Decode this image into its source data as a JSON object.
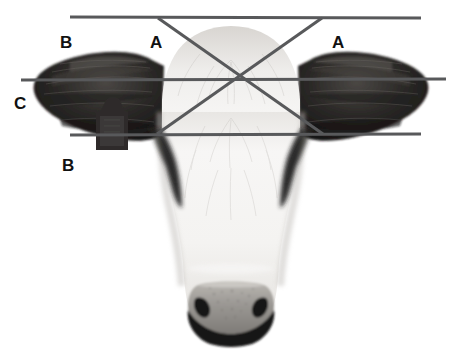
{
  "figure": {
    "background_color": "#ffffff",
    "width_px": 461,
    "height_px": 356
  },
  "annotation": {
    "line_color": "#58595b",
    "line_width_px": 3,
    "lines": [
      {
        "id": "top-horizontal",
        "name": "top-horizontal-line",
        "x1": 70,
        "y1": 17,
        "x2": 421,
        "y2": 18
      },
      {
        "id": "middle-horizontal",
        "name": "middle-horizontal-line",
        "x1": 21,
        "y1": 80,
        "x2": 446,
        "y2": 79
      },
      {
        "id": "bottom-horizontal",
        "name": "bottom-horizontal-line",
        "x1": 70,
        "y1": 135,
        "x2": 421,
        "y2": 134
      },
      {
        "id": "diagonal-left-to-right",
        "name": "diagonal-down-right-line",
        "x1": 158,
        "y1": 18,
        "x2": 323,
        "y2": 134
      },
      {
        "id": "diagonal-right-to-left",
        "name": "diagonal-down-left-line",
        "x1": 322,
        "y1": 18,
        "x2": 157,
        "y2": 134
      }
    ],
    "intersection": {
      "name": "cross-intersection-point",
      "x": 240,
      "y": 79
    }
  },
  "labels": [
    {
      "id": "label-b-top-left",
      "text": "B",
      "x": 60,
      "y": 34
    },
    {
      "id": "label-a-left",
      "text": "A",
      "x": 150,
      "y": 34
    },
    {
      "id": "label-a-right",
      "text": "A",
      "x": 332,
      "y": 34
    },
    {
      "id": "label-c-left",
      "text": "C",
      "x": 14,
      "y": 95
    },
    {
      "id": "label-b-bottom-left",
      "text": "B",
      "x": 62,
      "y": 157
    }
  ],
  "photo": {
    "description": "Black and white frontal photograph of a white-faced cow head with dark ears",
    "parts": {
      "left_ear": "left-ear",
      "right_ear": "right-ear",
      "ear_tag": "ear-tag",
      "forehead": "forehead",
      "muzzle": "muzzle",
      "nostril_left": "left-nostril",
      "nostril_right": "right-nostril",
      "eye_patch_left": "left-eye-patch",
      "eye_patch_right": "right-eye-patch"
    },
    "palette": {
      "white_face": "#f2f1ef",
      "face_shadow": "#d9d7d4",
      "ear_dark": "#19181a",
      "ear_mid": "#33312f",
      "ear_highlight": "#6a6663",
      "muzzle_grey": "#8d8a86",
      "muzzle_dark": "#1b1a1a",
      "tag_grey": "#3a3836"
    }
  }
}
